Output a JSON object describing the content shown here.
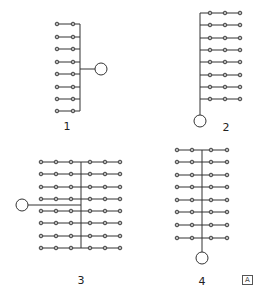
{
  "figure": {
    "panels": [
      {
        "id": "1",
        "label": "1",
        "layout": "two dots per row, common bus on right, source circle to the right",
        "rows": 8,
        "dots_per_row": 2
      },
      {
        "id": "2",
        "label": "2",
        "layout": "three dots per row, common bus on left, source circle at bottom",
        "rows": 8,
        "dots_per_row": 3
      },
      {
        "id": "3",
        "label": "3",
        "layout": "six dots per row, central bus, source circle to the left",
        "rows": 8,
        "dots_per_row": 6
      },
      {
        "id": "4",
        "label": "4",
        "layout": "four dots per row, central bus, source circle at bottom",
        "rows": 8,
        "dots_per_row": 4
      }
    ],
    "logo": {
      "icon": "publisher-mark-icon",
      "text": "A"
    }
  },
  "geometry": {
    "p1": {
      "bus_x": 80,
      "dots_x": [
        57,
        73
      ],
      "rows_y": [
        24,
        37,
        49,
        62,
        74,
        87,
        99,
        111
      ],
      "source": {
        "cx": 101,
        "cy": 69,
        "r": 6
      },
      "label_pos": [
        67,
        130
      ]
    },
    "p2": {
      "bus_x": 200,
      "dots_x": [
        210,
        225,
        240
      ],
      "rows_y": [
        13,
        25,
        38,
        50,
        62,
        75,
        87,
        99
      ],
      "source": {
        "cx": 200,
        "cy": 121,
        "r": 6
      },
      "label_pos": [
        226,
        131
      ]
    },
    "p3": {
      "bus_x": 81,
      "dots_x": [
        41,
        56,
        71,
        90,
        105,
        120
      ],
      "rows_y": [
        162,
        174,
        187,
        199,
        211,
        223,
        236,
        248
      ],
      "source": {
        "cx": 22,
        "cy": 205,
        "r": 6
      },
      "feeder_y": 205,
      "label_pos": [
        81,
        284
      ]
    },
    "p4": {
      "bus_x": 202,
      "dots_x": [
        177,
        192,
        211,
        227
      ],
      "rows_y": [
        150,
        162,
        175,
        187,
        200,
        212,
        225,
        238
      ],
      "source": {
        "cx": 202,
        "cy": 258,
        "r": 6
      },
      "label_pos": [
        202,
        285
      ]
    }
  }
}
